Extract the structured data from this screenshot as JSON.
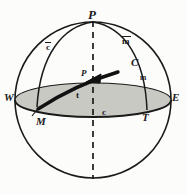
{
  "figure": {
    "type": "geometric-diagram",
    "colors": {
      "stroke": "#1a1a1a",
      "background": "#fcfcfa",
      "plane_fill": "#c9c9c4",
      "plane_edge": "#1a1a1a",
      "vector": "#111111"
    },
    "geometry": {
      "sphere_center": [
        93,
        100
      ],
      "sphere_radius": 78,
      "plane_ellipse_rx": 78,
      "plane_ellipse_ry": 17,
      "polar_axis": "dashed vertical from pole P through center to south"
    }
  },
  "labels": {
    "pole_top": "P",
    "meridian_left": "c",
    "meridian_right": "m",
    "vector_origin": "C",
    "small_m": "m",
    "center_point": "P",
    "west": "W",
    "east": "E",
    "meridian_foot": "M",
    "plane_arc": "c",
    "plane_point": "T",
    "arc_t": "t"
  },
  "label_notes": {
    "meridian_left_overbar": true,
    "meridian_right_overbar": true
  }
}
